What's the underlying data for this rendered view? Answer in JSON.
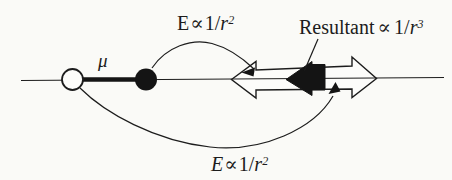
{
  "figure": {
    "background_color": "#fafaf7",
    "ink_color": "#1c1c1c",
    "labels": {
      "dipole_moment": "μ",
      "top_field": {
        "symbol": "E",
        "prop": "∝",
        "num": "1/",
        "var": "r",
        "exp": "2"
      },
      "resultant": {
        "word": "Resultant",
        "prop": "∝",
        "num": "1/",
        "var": "r",
        "exp": "3"
      },
      "bottom_field": {
        "symbol": "E",
        "prop": "∝",
        "num": "1/",
        "var": "r",
        "exp": "2"
      }
    }
  }
}
